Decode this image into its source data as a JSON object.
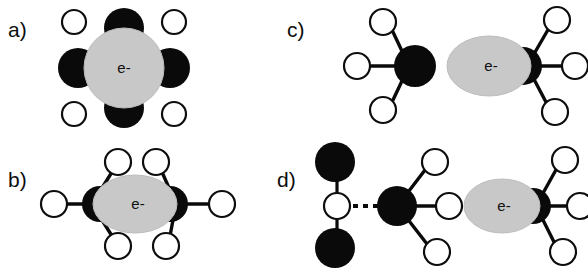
{
  "figure": {
    "type": "scientific-diagram",
    "background_color": "#ffffff",
    "electron_label": "e-",
    "colors": {
      "electron_cavity": "#c8c8c8",
      "electron_cavity_edge": "#bdbdbd",
      "heavy_atom": "#0a0a0a",
      "light_atom_fill": "#ffffff",
      "light_atom_stroke": "#0d0d0d",
      "bond": "#0a0a0a",
      "label_text": "#0d0d0d"
    },
    "legend_notes": {
      "black_disc": "heavy atom / lone-pair lobe",
      "white_circle": "hydrogen atom",
      "gray_blob": "electron density cavity",
      "dashed_line": "hydrogen bond"
    }
  },
  "panels": [
    {
      "id": "a",
      "label": "a)",
      "electron_label": "e-",
      "cavity_shape": "circle",
      "black_lobes": 4,
      "lobe_positions": [
        "top",
        "bottom",
        "left",
        "right"
      ],
      "white_circles": 4,
      "white_circle_positions": [
        "top-left",
        "top-right",
        "bottom-left",
        "bottom-right"
      ],
      "bonds": 0,
      "dashed_bonds": 0
    },
    {
      "id": "b",
      "label": "b)",
      "electron_label": "e-",
      "cavity_shape": "ellipse",
      "black_lobes": 2,
      "lobe_positions": [
        "left",
        "right"
      ],
      "white_circles": 6,
      "bonds": 6,
      "dashed_bonds": 0
    },
    {
      "id": "c",
      "label": "c)",
      "electron_label": "e-",
      "cavity_shape": "ellipse",
      "groups": [
        {
          "name": "free-molecule",
          "center": "black-disc",
          "white_circles": 3,
          "bonds": 3
        },
        {
          "name": "cavity-molecule",
          "center": "black-crescent-right",
          "white_circles": 3,
          "bonds": 3
        }
      ],
      "black_lobes": 1,
      "lobe_positions": [
        "right"
      ],
      "white_circles": 6,
      "bonds": 6,
      "dashed_bonds": 0
    },
    {
      "id": "d",
      "label": "d)",
      "electron_label": "e-",
      "cavity_shape": "ellipse",
      "groups": [
        {
          "name": "hydrogen-bonded-cluster",
          "center": "black-disc",
          "white_circles": 3,
          "bonds": 3,
          "bridge": {
            "white_circles": 1,
            "black_discs": 2,
            "bonds": 2,
            "dashed_bonds": 1
          }
        },
        {
          "name": "cavity-molecule",
          "center": "black-crescent-right",
          "white_circles": 3,
          "bonds": 3
        }
      ],
      "black_lobes": 1,
      "lobe_positions": [
        "right"
      ],
      "white_circles": 7,
      "bonds": 5,
      "dashed_bonds": 1
    }
  ]
}
